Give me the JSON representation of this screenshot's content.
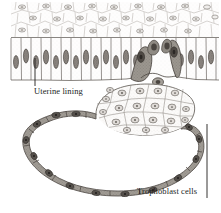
{
  "figure": {
    "name": "blastocyst-implantation-diagram",
    "background_color": "#ffffff",
    "width": 221,
    "height": 213
  },
  "labels": [
    {
      "id": "uterine-lining",
      "text": "Uterine lining",
      "x": 34,
      "y": 86,
      "leader": {
        "x1": 35,
        "y1": 86,
        "x2": 35,
        "y2": 58
      }
    },
    {
      "id": "trophoblast-cells",
      "text": "Trophoblast cells",
      "x": 137,
      "y": 186,
      "leader": {
        "x1": 207,
        "y1": 198,
        "x2": 207,
        "y2": 124
      }
    }
  ],
  "colors": {
    "ink": "#201d1c",
    "line": "#5d5954",
    "faint_line": "#a8a39d",
    "stroma_fill": "#fbfafa",
    "columnar_fill": "#fdfcfb",
    "columnar_nucleus": "#8d8782",
    "trophoblast_fill": "#9b968f",
    "trophoblast_dark": "#6d6863",
    "trophoblast_nucleus": "#4a4540",
    "icm_fill": "#fcfbfa",
    "icm_nucleus": "#8a847e",
    "blastocoel": "#ffffff"
  },
  "structures": {
    "stroma": {
      "name": "uterine-stroma-layer",
      "description": "irregular polygonal stromal cells with oval nuclei",
      "y_range": [
        2,
        37
      ],
      "cell_count": 26
    },
    "columnar_epithelium": {
      "name": "columnar-epithelium-layer",
      "description": "tall columnar cells with elongated nuclei",
      "y_range": [
        37,
        80
      ],
      "cell_count": 22
    },
    "inner_cell_mass": {
      "name": "inner-cell-mass",
      "description": "cluster of polygonal embryoblast cells with speckled nuclei",
      "cell_count": 22
    },
    "trophoblast_ring": {
      "name": "trophoblast-ring",
      "description": "thin ring of flattened trophoblast cells enclosing the blastocoel",
      "cell_count": 11
    },
    "invading_trophoblast": {
      "name": "invading-trophoblast-cells",
      "description": "dark syncytiotrophoblast cells penetrating the epithelium",
      "cell_count": 6
    },
    "blastocoel": {
      "name": "blastocoel-cavity",
      "description": "fluid-filled cavity of the blastocyst"
    }
  }
}
